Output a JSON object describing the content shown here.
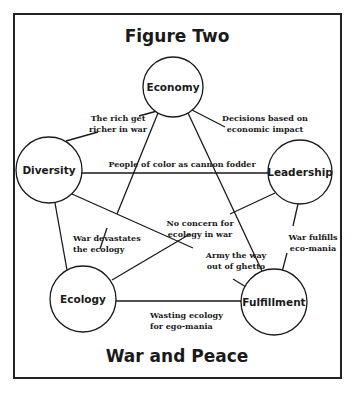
{
  "title": "Figure Two",
  "subtitle": "War and Peace",
  "nodes": [
    {
      "id": "economy",
      "label": "Economy"
    },
    {
      "id": "diversity",
      "label": "Diversity"
    },
    {
      "id": "leadership",
      "label": "Leadership"
    },
    {
      "id": "ecology",
      "label": "Ecology"
    },
    {
      "id": "fulfillment",
      "label": "Fulfillment"
    }
  ],
  "edges": [
    {
      "from": "economy",
      "to": "diversity",
      "label": [
        "The rich get",
        "richer in war"
      ]
    },
    {
      "from": "economy",
      "to": "leadership",
      "label": [
        "Decisions based on",
        "economic impact"
      ]
    },
    {
      "from": "diversity",
      "to": "leadership",
      "label": [
        "People of color as cannon fodder"
      ]
    },
    {
      "from": "economy",
      "to": "ecology",
      "label": [
        "War devastates",
        "the ecology"
      ]
    },
    {
      "from": "economy",
      "to": "fulfillment",
      "label": []
    },
    {
      "from": "leadership",
      "to": "ecology",
      "label": [
        "No concern for",
        "ecology in war"
      ]
    },
    {
      "from": "diversity",
      "to": "fulfillment",
      "label": [
        "Army the way",
        "out of ghetto"
      ]
    },
    {
      "from": "leadership",
      "to": "fulfillment",
      "label": [
        "War fulfills",
        "eco-mania"
      ]
    },
    {
      "from": "ecology",
      "to": "fulfillment",
      "label": [
        "Wasting ecology",
        "for ego-mania"
      ]
    },
    {
      "from": "diversity",
      "to": "ecology",
      "label": []
    }
  ]
}
